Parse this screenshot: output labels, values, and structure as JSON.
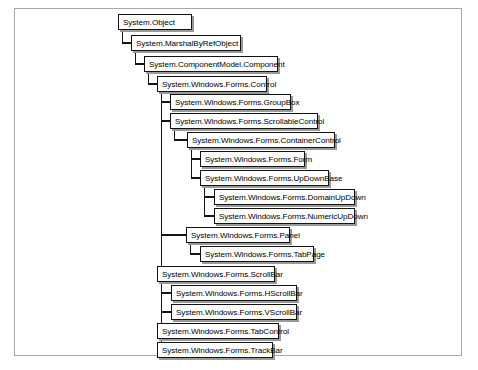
{
  "diagram": {
    "type": "class-inheritance-tree",
    "frame": {
      "border_color": "#a8a8a8"
    },
    "node_style": {
      "fill": "#ffffff",
      "border_color": "#121212",
      "shadow_color": "#9a9a9a",
      "text_color": "#000000"
    },
    "nodes": [
      {
        "id": "object",
        "label": "System.Object",
        "depth": 0,
        "x": 118,
        "y": 14,
        "w": 74
      },
      {
        "id": "marshalbyrefobject",
        "label": "System.MarshalByRefObject",
        "depth": 1,
        "x": 131,
        "y": 35,
        "w": 110
      },
      {
        "id": "component",
        "label": "System.ComponentModel.Component",
        "depth": 2,
        "x": 144,
        "y": 56,
        "w": 134
      },
      {
        "id": "control",
        "label": "System.Windows.Forms.Control",
        "depth": 3,
        "x": 157,
        "y": 76,
        "w": 110
      },
      {
        "id": "groupbox",
        "label": "System.Windows.Forms.GroupBox",
        "depth": 4,
        "x": 170,
        "y": 94,
        "w": 121
      },
      {
        "id": "scrollablecontrol",
        "label": "System.Windows.Forms.ScrollableControl",
        "depth": 4,
        "x": 170,
        "y": 113,
        "w": 148
      },
      {
        "id": "containercontrol",
        "label": "System.Windows.Forms.ContainerControl",
        "depth": 5,
        "x": 187,
        "y": 132,
        "w": 148
      },
      {
        "id": "form",
        "label": "System.Windows.Forms.Form",
        "depth": 6,
        "x": 200,
        "y": 151,
        "w": 105
      },
      {
        "id": "updownbase",
        "label": "System.Windows.Forms.UpDownBase",
        "depth": 6,
        "x": 200,
        "y": 170,
        "w": 129
      },
      {
        "id": "domainupdown",
        "label": "System.Windows.Forms.DomainUpDown",
        "depth": 7,
        "x": 214,
        "y": 189,
        "w": 141
      },
      {
        "id": "numericupdown",
        "label": "System.Windows.Forms.NumericUpDown",
        "depth": 7,
        "x": 214,
        "y": 208,
        "w": 141
      },
      {
        "id": "panel",
        "label": "System.Windows.Forms.Panel",
        "depth": 4,
        "x": 186,
        "y": 227,
        "w": 104
      },
      {
        "id": "tabpage",
        "label": "System.Windows.Forms.TabPage",
        "depth": 5,
        "x": 200,
        "y": 246,
        "w": 114
      },
      {
        "id": "scrollbar",
        "label": "System.Windows.Forms.ScrollBar",
        "depth": 4,
        "x": 157,
        "y": 266,
        "w": 118
      },
      {
        "id": "hscrollbar",
        "label": "System.Windows.Forms.HScrollBar",
        "depth": 5,
        "x": 171,
        "y": 285,
        "w": 126
      },
      {
        "id": "vscrollbar",
        "label": "System.Windows.Forms.VScrollBar",
        "depth": 5,
        "x": 171,
        "y": 304,
        "w": 126
      },
      {
        "id": "tabcontrol",
        "label": "System.Windows.Forms.TabControl",
        "depth": 4,
        "x": 157,
        "y": 323,
        "w": 122
      },
      {
        "id": "trackbar",
        "label": "System.Windows.Forms.TrackBar",
        "depth": 4,
        "x": 157,
        "y": 342,
        "w": 116
      }
    ],
    "edges": [
      {
        "from": "object",
        "to": "marshalbyrefobject"
      },
      {
        "from": "marshalbyrefobject",
        "to": "component"
      },
      {
        "from": "component",
        "to": "control"
      },
      {
        "from": "control",
        "to": "groupbox"
      },
      {
        "from": "control",
        "to": "scrollablecontrol"
      },
      {
        "from": "control",
        "to": "panel"
      },
      {
        "from": "control",
        "to": "scrollbar"
      },
      {
        "from": "control",
        "to": "tabcontrol"
      },
      {
        "from": "control",
        "to": "trackbar"
      },
      {
        "from": "scrollablecontrol",
        "to": "containercontrol"
      },
      {
        "from": "containercontrol",
        "to": "form"
      },
      {
        "from": "containercontrol",
        "to": "updownbase"
      },
      {
        "from": "updownbase",
        "to": "domainupdown"
      },
      {
        "from": "updownbase",
        "to": "numericupdown"
      },
      {
        "from": "panel",
        "to": "tabpage"
      },
      {
        "from": "scrollbar",
        "to": "hscrollbar"
      },
      {
        "from": "scrollbar",
        "to": "vscrollbar"
      }
    ]
  }
}
